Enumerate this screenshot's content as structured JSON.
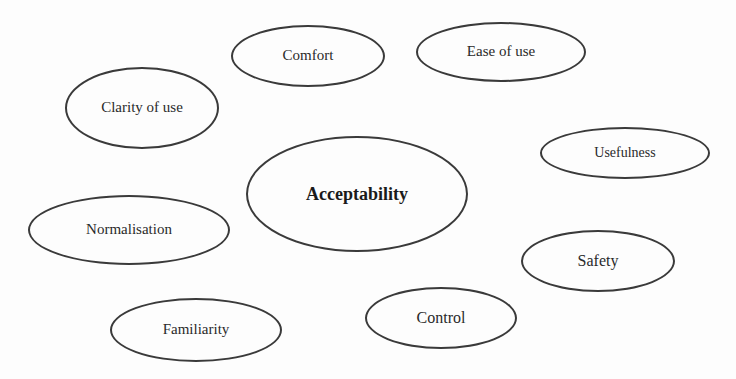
{
  "diagram": {
    "center": {
      "label": "Acceptability",
      "cx": 357,
      "cy": 194,
      "rx": 111,
      "ry": 58
    },
    "nodes": [
      {
        "id": "comfort",
        "label": "Comfort",
        "cx": 308,
        "cy": 56,
        "rx": 77,
        "ry": 31
      },
      {
        "id": "ease-of-use",
        "label": "Ease of use",
        "cx": 501,
        "cy": 52,
        "rx": 85,
        "ry": 30
      },
      {
        "id": "clarity-of-use",
        "label": "Clarity of use",
        "cx": 142,
        "cy": 108,
        "rx": 77,
        "ry": 41
      },
      {
        "id": "usefulness",
        "label": "Usefulness",
        "cx": 625,
        "cy": 153,
        "rx": 85,
        "ry": 26
      },
      {
        "id": "normalisation",
        "label": "Normalisation",
        "cx": 129,
        "cy": 230,
        "rx": 101,
        "ry": 35
      },
      {
        "id": "safety",
        "label": "Safety",
        "cx": 598,
        "cy": 261,
        "rx": 77,
        "ry": 31
      },
      {
        "id": "control",
        "label": "Control",
        "cx": 441,
        "cy": 318,
        "rx": 76,
        "ry": 31
      },
      {
        "id": "familiarity",
        "label": "Familiarity",
        "cx": 196,
        "cy": 330,
        "rx": 86,
        "ry": 32
      }
    ],
    "colors": {
      "stroke": "#3a3a3a",
      "text": "#2a2a2a",
      "background": "#fdfdfd"
    }
  }
}
